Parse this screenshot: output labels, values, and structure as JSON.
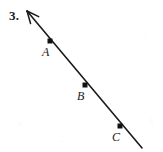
{
  "figure": {
    "problem_number": "3.",
    "background_color": "#ffffff",
    "ink_color": "#1a1a1a",
    "width": 163,
    "height": 152,
    "line": {
      "type": "ray",
      "arrow_end": "upper-left",
      "arrow_tip": {
        "x": 27,
        "y": 11
      },
      "tail_end": {
        "x": 142,
        "y": 148
      },
      "stroke_width": 1.6
    },
    "points": [
      {
        "label": "A",
        "dot": {
          "x": 50,
          "y": 41
        },
        "dot_size": 5,
        "label_pos": {
          "x": 42,
          "y": 46
        }
      },
      {
        "label": "B",
        "dot": {
          "x": 85,
          "y": 85
        },
        "dot_size": 5,
        "label_pos": {
          "x": 77,
          "y": 90
        }
      },
      {
        "label": "C",
        "dot": {
          "x": 120,
          "y": 126
        },
        "dot_size": 5,
        "label_pos": {
          "x": 112,
          "y": 131
        }
      }
    ]
  }
}
